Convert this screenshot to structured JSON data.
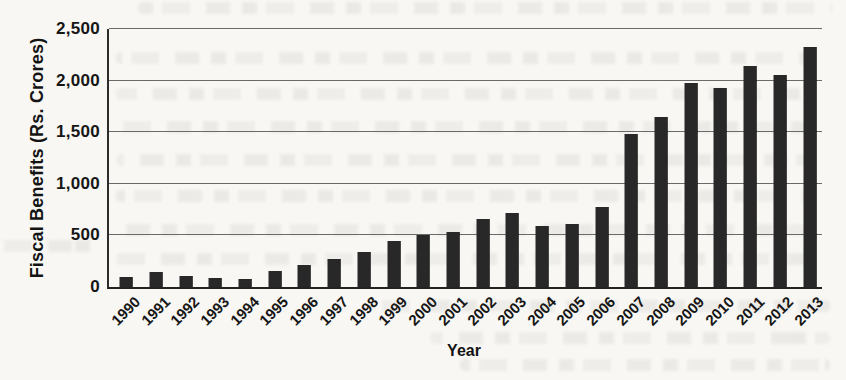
{
  "chart_data": {
    "type": "bar",
    "title": "",
    "xlabel": "Year",
    "ylabel": "Fiscal Benefits (Rs. Crores)",
    "ylim": [
      0,
      2500
    ],
    "ytick_step": 500,
    "ytick_labels": [
      "0",
      "500",
      "1,000",
      "1,500",
      "2,000",
      "2,500"
    ],
    "grid": true,
    "legend": "none",
    "bar_color": "#282828",
    "categories": [
      "1990",
      "1991",
      "1992",
      "1993",
      "1994",
      "1995",
      "1996",
      "1997",
      "1998",
      "1999",
      "2000",
      "2001",
      "2002",
      "2003",
      "2004",
      "2005",
      "2006",
      "2007",
      "2008",
      "2009",
      "2010",
      "2011",
      "2012",
      "2013"
    ],
    "values": [
      100,
      150,
      105,
      90,
      80,
      160,
      215,
      270,
      340,
      450,
      500,
      530,
      655,
      720,
      595,
      615,
      780,
      1480,
      1650,
      1975,
      1930,
      2140,
      2055,
      2330
    ]
  },
  "colors": {
    "paper": "#f8f7f3",
    "bar": "#282828",
    "gridline": "#6a6a6a",
    "text": "#161616"
  }
}
